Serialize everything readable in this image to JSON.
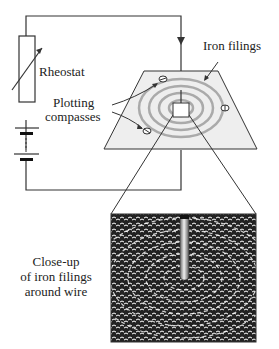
{
  "labels": {
    "rheostat": "Rheostat",
    "iron_filings": "Iron filings",
    "plotting_line1": "Plotting",
    "plotting_line2": "compasses",
    "closeup_line1": "Close-up",
    "closeup_line2": "of iron filings",
    "closeup_line3": "around wire"
  },
  "colors": {
    "line": "#333333",
    "plate_fill": "#e8e8e8",
    "ring": "#a8a8a8",
    "filings_bg": "#1a1a1a",
    "wire_light": "#e0e0e0",
    "wire_dark": "#555555"
  }
}
